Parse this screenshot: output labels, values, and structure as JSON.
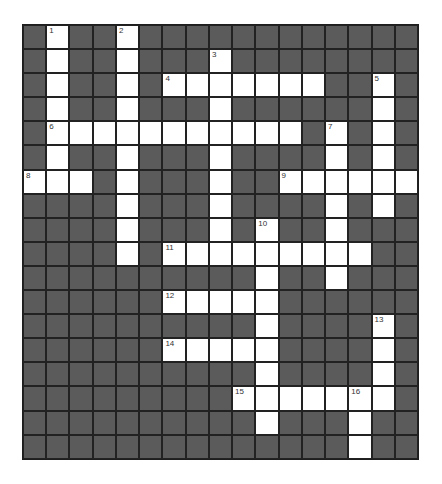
{
  "puzzle": {
    "cols": 17,
    "rows": 18,
    "colors": {
      "block": "#5b5b5b",
      "open": "#ffffff",
      "border": "#222222",
      "number": "#333333"
    },
    "open_cells": [
      [
        0,
        1
      ],
      [
        0,
        4
      ],
      [
        1,
        1
      ],
      [
        1,
        4
      ],
      [
        1,
        8
      ],
      [
        2,
        1
      ],
      [
        2,
        4
      ],
      [
        2,
        6
      ],
      [
        2,
        7
      ],
      [
        2,
        8
      ],
      [
        2,
        9
      ],
      [
        2,
        10
      ],
      [
        2,
        11
      ],
      [
        2,
        12
      ],
      [
        2,
        15
      ],
      [
        3,
        1
      ],
      [
        3,
        4
      ],
      [
        3,
        8
      ],
      [
        3,
        15
      ],
      [
        4,
        1
      ],
      [
        4,
        2
      ],
      [
        4,
        3
      ],
      [
        4,
        4
      ],
      [
        4,
        5
      ],
      [
        4,
        6
      ],
      [
        4,
        7
      ],
      [
        4,
        8
      ],
      [
        4,
        9
      ],
      [
        4,
        10
      ],
      [
        4,
        11
      ],
      [
        4,
        13
      ],
      [
        4,
        15
      ],
      [
        5,
        1
      ],
      [
        5,
        4
      ],
      [
        5,
        8
      ],
      [
        5,
        13
      ],
      [
        5,
        15
      ],
      [
        6,
        0
      ],
      [
        6,
        1
      ],
      [
        6,
        2
      ],
      [
        6,
        4
      ],
      [
        6,
        8
      ],
      [
        6,
        11
      ],
      [
        6,
        12
      ],
      [
        6,
        13
      ],
      [
        6,
        14
      ],
      [
        6,
        15
      ],
      [
        6,
        16
      ],
      [
        7,
        4
      ],
      [
        7,
        8
      ],
      [
        7,
        13
      ],
      [
        7,
        15
      ],
      [
        8,
        4
      ],
      [
        8,
        8
      ],
      [
        8,
        10
      ],
      [
        8,
        13
      ],
      [
        9,
        4
      ],
      [
        9,
        6
      ],
      [
        9,
        7
      ],
      [
        9,
        8
      ],
      [
        9,
        9
      ],
      [
        9,
        10
      ],
      [
        9,
        11
      ],
      [
        9,
        12
      ],
      [
        9,
        13
      ],
      [
        9,
        14
      ],
      [
        10,
        10
      ],
      [
        10,
        13
      ],
      [
        11,
        6
      ],
      [
        11,
        7
      ],
      [
        11,
        8
      ],
      [
        11,
        9
      ],
      [
        11,
        10
      ],
      [
        12,
        10
      ],
      [
        12,
        15
      ],
      [
        13,
        6
      ],
      [
        13,
        7
      ],
      [
        13,
        8
      ],
      [
        13,
        9
      ],
      [
        13,
        10
      ],
      [
        13,
        15
      ],
      [
        14,
        10
      ],
      [
        14,
        15
      ],
      [
        15,
        9
      ],
      [
        15,
        10
      ],
      [
        15,
        11
      ],
      [
        15,
        12
      ],
      [
        15,
        13
      ],
      [
        15,
        14
      ],
      [
        15,
        15
      ],
      [
        16,
        10
      ],
      [
        16,
        14
      ],
      [
        17,
        14
      ]
    ],
    "clue_numbers": [
      {
        "row": 0,
        "col": 1,
        "label": "1"
      },
      {
        "row": 0,
        "col": 4,
        "label": "2"
      },
      {
        "row": 1,
        "col": 8,
        "label": "3"
      },
      {
        "row": 2,
        "col": 6,
        "label": "4"
      },
      {
        "row": 2,
        "col": 15,
        "label": "5"
      },
      {
        "row": 4,
        "col": 1,
        "label": "6"
      },
      {
        "row": 4,
        "col": 13,
        "label": "7"
      },
      {
        "row": 6,
        "col": 0,
        "label": "8"
      },
      {
        "row": 6,
        "col": 11,
        "label": "9"
      },
      {
        "row": 8,
        "col": 10,
        "label": "10"
      },
      {
        "row": 9,
        "col": 6,
        "label": "11"
      },
      {
        "row": 11,
        "col": 6,
        "label": "12"
      },
      {
        "row": 12,
        "col": 15,
        "label": "13"
      },
      {
        "row": 13,
        "col": 6,
        "label": "14"
      },
      {
        "row": 15,
        "col": 9,
        "label": "15"
      },
      {
        "row": 15,
        "col": 14,
        "label": "16"
      }
    ]
  }
}
